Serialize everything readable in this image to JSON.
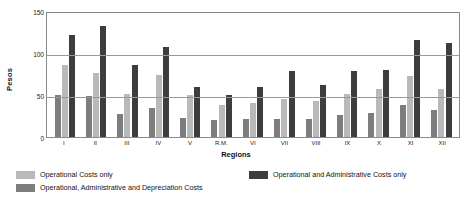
{
  "chart_data": {
    "type": "bar",
    "title": "",
    "xlabel": "Regions",
    "ylabel": "Pesos",
    "ylim": [
      0,
      150
    ],
    "yticks": [
      0,
      50,
      100,
      150
    ],
    "grid": true,
    "legend_position": "bottom",
    "categories": [
      "I",
      "II",
      "III",
      "IV",
      "V",
      "R.M.",
      "VI",
      "VII",
      "VIII",
      "IX",
      "X",
      "XI",
      "XII"
    ],
    "series": [
      {
        "name": "Operational, Administrative and Depreciation Costs",
        "color": "#7d7d7d",
        "values": [
          50,
          49,
          27,
          35,
          23,
          20,
          22,
          21,
          22,
          26,
          29,
          38,
          32
        ]
      },
      {
        "name": "Operational Costs only",
        "color": "#b9b9b9",
        "values": [
          86,
          76,
          51,
          74,
          50,
          38,
          41,
          45,
          43,
          51,
          57,
          73,
          57
        ]
      },
      {
        "name": "Operational and Administrative Costs only",
        "color": "#3d3d3d",
        "values": [
          122,
          132,
          86,
          107,
          59,
          50,
          59,
          79,
          62,
          78,
          80,
          116,
          112
        ]
      }
    ]
  },
  "legend": {
    "items": [
      {
        "label": "Operational Costs only",
        "color": "#b9b9b9"
      },
      {
        "label": "Operational, Administrative and Depreciation Costs",
        "color": "#7d7d7d"
      },
      {
        "label": "Operational and Administrative Costs only",
        "color": "#3d3d3d"
      }
    ]
  }
}
